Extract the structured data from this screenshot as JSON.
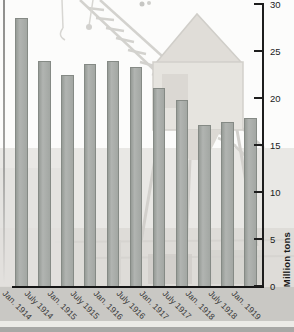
{
  "chart_data": {
    "type": "bar",
    "title": "",
    "xlabel": "",
    "ylabel": "Million tons",
    "categories": [
      "Jan. 1914",
      "July 1914",
      "Jan. 1915",
      "July 1915",
      "Jan. 1916",
      "July 1916",
      "Jan. 1917",
      "July 1917",
      "Jan. 1918",
      "July 1918",
      "Jan. 1919"
    ],
    "values": [
      28.5,
      23.9,
      22.4,
      23.6,
      23.9,
      23.3,
      21.1,
      19.8,
      17.1,
      17.4,
      17.9
    ],
    "ylim": [
      0,
      30
    ],
    "yticks": [
      0,
      5,
      10,
      15,
      20,
      25,
      30
    ],
    "grid": false,
    "legend": null,
    "axis_side": "right",
    "bar_color": "#a3a7a3",
    "bar_border_color": "#858a85",
    "axis_color": "#1d1d1d",
    "label_band_color": "#c9c8c4",
    "background_photo": "faded black-and-white dockside crane photograph"
  }
}
